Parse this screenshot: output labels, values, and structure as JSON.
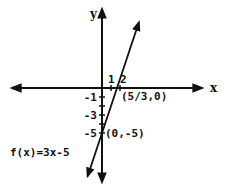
{
  "chart_data": {
    "type": "line",
    "title": "",
    "function_label": "f(x)=3x-5",
    "xlabel": "x",
    "ylabel": "y",
    "xlim": [
      -10,
      11
    ],
    "ylim": [
      -10,
      8.5
    ],
    "grid": false,
    "x_ticks": [
      {
        "value": 1,
        "label": "1"
      },
      {
        "value": 2,
        "label": "2"
      }
    ],
    "y_ticks": [
      {
        "value": -1,
        "label": "-1"
      },
      {
        "value": -2,
        "label": ""
      },
      {
        "value": -3,
        "label": "-3"
      },
      {
        "value": -4,
        "label": ""
      },
      {
        "value": -5,
        "label": "-5"
      }
    ],
    "series": [
      {
        "name": "f(x)=3x-5",
        "slope": 3,
        "intercept": -5,
        "x_range": [
          -1.6,
          4.1
        ]
      }
    ],
    "annotations": [
      {
        "text": "(5/3,0)",
        "x": 1.6667,
        "y": 0
      },
      {
        "text": "(0,-5)",
        "x": 0,
        "y": -5
      }
    ],
    "color": "#111111"
  }
}
